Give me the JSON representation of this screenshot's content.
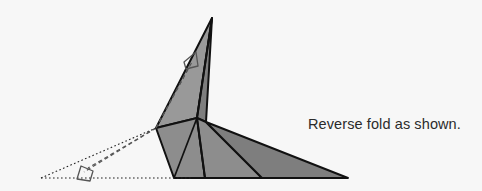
{
  "page": {
    "width": 482,
    "height": 191,
    "background_color": "#f7f7f7",
    "canvas_color": "#f8f8f8"
  },
  "step": {
    "number": "4",
    "number_color": "#fdfdfd"
  },
  "caption": {
    "text": "Reverse fold as shown.",
    "color": "#2b2b2b"
  },
  "diagram": {
    "type": "origami-instruction",
    "colors": {
      "paper_fill": "#8d8d8d",
      "paper_fill_light": "#999999",
      "paper_fill_dark": "#7e7e7e",
      "outline": "#111111",
      "fold_line": "#555555",
      "reference_line": "#222222"
    },
    "shapes": [
      {
        "name": "upper-point-left-face",
        "fill_key": "paper_fill_light",
        "points": "212,18 197,118 156,128"
      },
      {
        "name": "upper-point-right-face",
        "fill_key": "paper_fill_dark",
        "points": "212,18 206,122 197,118"
      },
      {
        "name": "body-left-panel",
        "fill_key": "paper_fill",
        "points": "156,128 197,118 205,178 174,178"
      },
      {
        "name": "body-mid-panel",
        "fill_key": "paper_fill",
        "points": "197,118 206,122 262,178 205,178"
      },
      {
        "name": "body-right-tail",
        "fill_key": "paper_fill_dark",
        "points": "206,122 348,178 262,178"
      }
    ],
    "lines": [
      {
        "name": "body-crease-left",
        "kind": "crease",
        "x1": 197,
        "y1": 118,
        "x2": 174,
        "y2": 178
      },
      {
        "name": "body-crease-mid",
        "kind": "crease",
        "x1": 197,
        "y1": 118,
        "x2": 205,
        "y2": 178
      },
      {
        "name": "point-center-crease",
        "kind": "crease",
        "x1": 212,
        "y1": 18,
        "x2": 197,
        "y2": 118
      }
    ],
    "fold_lines": [
      {
        "name": "reverse-fold-line-upper",
        "dash": "4,3",
        "x1": 156,
        "y1": 128,
        "x2": 192,
        "y2": 62
      },
      {
        "name": "reverse-fold-line-lower",
        "dash": "4,3",
        "x1": 156,
        "y1": 128,
        "x2": 88,
        "y2": 168
      },
      {
        "name": "reverse-fold-line-upper-2",
        "dash": "4,3",
        "x1": 156,
        "y1": 128,
        "x2": 189,
        "y2": 67
      },
      {
        "name": "reverse-fold-line-lower-2",
        "dash": "4,3",
        "x1": 156,
        "y1": 128,
        "x2": 84,
        "y2": 172
      }
    ],
    "reference_lines": [
      {
        "name": "baseline-dotted",
        "dash": "1.6,2.4",
        "x1": 41,
        "y1": 178,
        "x2": 191,
        "y2": 178
      },
      {
        "name": "diagonal-dotted",
        "dash": "1.6,2.4",
        "x1": 41,
        "y1": 178,
        "x2": 156,
        "y2": 128
      }
    ],
    "arrows": [
      {
        "name": "fold-arrow-up",
        "tip_x": 196,
        "tip_y": 58,
        "direction": "up-right"
      },
      {
        "name": "fold-arrow-down",
        "tip_x": 80,
        "tip_y": 176,
        "direction": "down-left"
      }
    ]
  }
}
